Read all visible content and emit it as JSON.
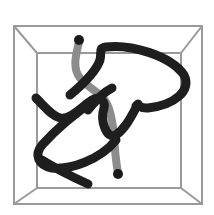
{
  "figure": {
    "colors": {
      "background": "#ffffff",
      "box_edge": "#9a9a9a",
      "tube_dark": "#1e1e1e",
      "tube_light": "#8c8c8c",
      "endpoint": "#1a1a1a"
    },
    "box": {
      "outer": {
        "x": 14,
        "y": 26,
        "w": 188,
        "h": 178
      },
      "inner": {
        "x": 37,
        "y": 53,
        "w": 144,
        "h": 135
      }
    },
    "endpoints": [
      {
        "name": "start",
        "x": 79,
        "y": 40
      },
      {
        "name": "end",
        "x": 118,
        "y": 174
      }
    ]
  }
}
